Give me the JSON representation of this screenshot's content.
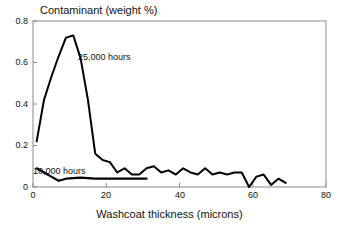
{
  "chart_data": {
    "type": "line",
    "title": "Contaminant (weight %)",
    "xlabel": "Washcoat thickness (microns)",
    "ylabel": "Contaminant (weight %)",
    "xlim": [
      0,
      80
    ],
    "ylim": [
      0,
      0.8
    ],
    "grid": false,
    "legend_position": "inline-annotation",
    "xticks": [
      0,
      20,
      40,
      60,
      80
    ],
    "xtick_labels": [
      "0",
      "20",
      "40",
      "60",
      "80"
    ],
    "yticks": [
      0,
      0.2,
      0.4,
      0.6,
      0.8
    ],
    "ytick_labels": [
      "0",
      "0.2",
      "0.4",
      "0.6",
      "0.8"
    ],
    "annotations": [
      {
        "text": "25,000 hours",
        "x": 12.5,
        "y": 0.64
      },
      {
        "text": "10,000 hours",
        "x": 2.5,
        "y": 0.115
      }
    ],
    "series": [
      {
        "name": "25,000 hours",
        "color": "#000000",
        "x": [
          1,
          3,
          5,
          7,
          9,
          11,
          13,
          15,
          17,
          19,
          21,
          23,
          25,
          27,
          29,
          31,
          33,
          35,
          37,
          39,
          41,
          43,
          45,
          47,
          49,
          51,
          53,
          55,
          57,
          59,
          61,
          63,
          65,
          67,
          69
        ],
        "y": [
          0.22,
          0.42,
          0.53,
          0.63,
          0.72,
          0.73,
          0.62,
          0.42,
          0.16,
          0.13,
          0.12,
          0.07,
          0.09,
          0.06,
          0.06,
          0.09,
          0.1,
          0.07,
          0.08,
          0.06,
          0.09,
          0.07,
          0.06,
          0.09,
          0.06,
          0.07,
          0.06,
          0.07,
          0.07,
          0.0,
          0.05,
          0.06,
          0.01,
          0.04,
          0.02
        ]
      },
      {
        "name": "10,000 hours",
        "color": "#000000",
        "x": [
          1,
          3,
          5,
          7,
          9,
          13,
          17,
          21,
          25,
          29,
          31
        ],
        "y": [
          0.09,
          0.07,
          0.05,
          0.03,
          0.04,
          0.045,
          0.04,
          0.04,
          0.04,
          0.04,
          0.04
        ]
      }
    ]
  },
  "axes": {
    "title": "Contaminant (weight %)",
    "xlabel": "Washcoat thickness (microns)"
  }
}
